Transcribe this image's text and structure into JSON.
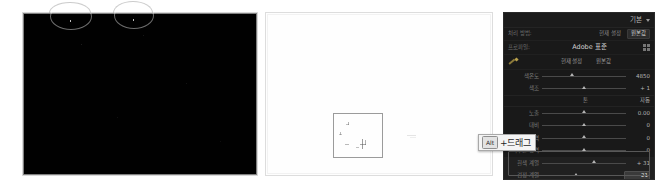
{
  "previews": {
    "dark": {
      "name": "underexposed-black-preview",
      "annotations": [
        {
          "label": "ellipse-annotation-1"
        },
        {
          "label": "ellipse-annotation-2"
        }
      ]
    },
    "light": {
      "name": "overexposed-white-preview",
      "selection_label": "crop-selection-rectangle"
    }
  },
  "panel": {
    "title": "기본",
    "caret_icon": "chevron-down-icon",
    "process": {
      "label": "처리 방법:",
      "tabs": [
        {
          "label": "현재 설정",
          "active": false
        },
        {
          "label": "원본값",
          "active": true
        }
      ]
    },
    "profile": {
      "label": "프로파일:",
      "value": "Adobe 표준",
      "browse_icon": "grid-icon"
    },
    "white_balance": {
      "tool_icon": "eyedropper-icon",
      "left_label": "현재 설정",
      "right_label": "원본값"
    },
    "wb_sliders": [
      {
        "label": "색온도",
        "value": "4850",
        "pos": 36
      },
      {
        "label": "색조",
        "value": "+ 1",
        "pos": 50
      }
    ],
    "tone_section": {
      "title": "톤",
      "action": "자동"
    },
    "tone_sliders": [
      {
        "label": "노출",
        "value": "0.00",
        "pos": 50,
        "highlight": false
      },
      {
        "label": "대비",
        "value": "0",
        "pos": 50,
        "highlight": false
      },
      {
        "label": "밝은 영역",
        "value": "0",
        "pos": 50,
        "highlight": false
      },
      {
        "label": "어두운 영역",
        "value": "0",
        "pos": 50,
        "highlight": false
      },
      {
        "label": "흰색 계열",
        "value": "+ 31",
        "pos": 62,
        "highlight": true
      },
      {
        "label": "검정 계열",
        "value": "− 21",
        "pos": 42,
        "highlight": true
      }
    ]
  },
  "tooltip": {
    "key": "Alt",
    "text": "+드래그"
  },
  "colors": {
    "panel_background": "#191919",
    "panel_text": "#8a8a8a",
    "value_text": "#b5b5b5",
    "slider_track": "#4a4a4a",
    "slider_thumb": "#b4b4b4",
    "highlight_row": "#202020",
    "tooltip_background": "#f4f4f4",
    "dark_preview": "#010101",
    "light_preview": "#fefefe"
  }
}
